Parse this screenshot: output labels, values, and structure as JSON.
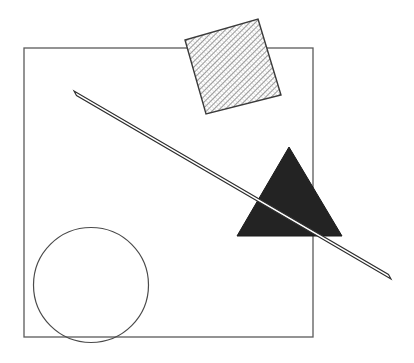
{
  "figure": {
    "title": "Geometric shapes composition",
    "canvas": {
      "width": 414,
      "height": 363,
      "background": "#ffffff"
    },
    "shapes": [
      {
        "id": "bounding-square",
        "name": "square",
        "label": "Square outline",
        "stroke": "#555555",
        "stroke_width": 1.2,
        "fill": "none",
        "x": 24,
        "y": 48,
        "width": 289,
        "height": 289,
        "corners": "24,48 313,48 313,337 24,337"
      },
      {
        "id": "hatched-square",
        "name": "rotated-hatched-square",
        "label": "Rotated hatched square",
        "stroke": "#3a3a3a",
        "stroke_width": 1.4,
        "fill": "hatch",
        "hatch_color": "#8a8a8a",
        "hatch_angle_deg": 45,
        "points": "258,19 281,95 206,114 185,40",
        "rotation_deg": 17
      },
      {
        "id": "diagonal-bar",
        "name": "diagonal-bar",
        "label": "Thin diagonal bar",
        "stroke": "#2e2e2e",
        "stroke_width": 1.1,
        "fill": "#ffffff",
        "points": "74.0,91.0 76.5,95.5 391.0,279.0 388.5,274.5",
        "start": "74,93",
        "end": "390,277"
      },
      {
        "id": "dark-triangle",
        "name": "filled-triangle",
        "label": "Solid dark triangle",
        "stroke": "#1a1a1a",
        "stroke_width": 1,
        "fill": "#232323",
        "points": "289,147 342,236 237,236",
        "apex": "289,147",
        "base_left": "237,236",
        "base_right": "342,236"
      },
      {
        "id": "circle-outline",
        "name": "circle",
        "label": "Circle outline",
        "stroke": "#4a4a4a",
        "stroke_width": 1.2,
        "fill": "none",
        "cx": 91,
        "cy": 285,
        "r": 57.5
      }
    ]
  }
}
